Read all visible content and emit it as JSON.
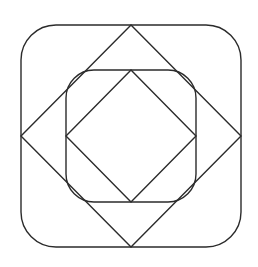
{
  "diagram": {
    "type": "nested-geometric-figure",
    "background": "#ffffff",
    "stroke_color": "#2b2b2b",
    "stroke_width": 1.4,
    "shapes": [
      {
        "name": "outer-rounded-square",
        "kind": "rounded-rect",
        "x": 21,
        "y": 25,
        "width": 220,
        "height": 222,
        "radius": 35
      },
      {
        "name": "outer-diamond",
        "kind": "polygon",
        "points": "131,25 241,136 131,247 21,136"
      },
      {
        "name": "inner-rounded-square",
        "kind": "rounded-rect",
        "x": 66,
        "y": 70,
        "width": 130,
        "height": 132,
        "radius": 28
      },
      {
        "name": "inner-diamond",
        "kind": "polygon",
        "points": "131,70 196,136 131,202 66,136"
      }
    ]
  }
}
